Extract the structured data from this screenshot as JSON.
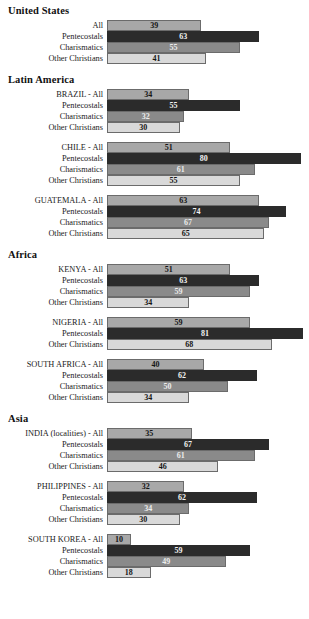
{
  "chart_data": {
    "type": "bar",
    "title": "",
    "subtitle": "",
    "xlabel": "",
    "ylabel": "",
    "xlim": [
      0,
      85
    ],
    "grid": false,
    "legend": null,
    "orientation": "horizontal",
    "series_names": [
      "All",
      "Pentecostals",
      "Charismatics",
      "Other Christians"
    ],
    "series_colors": {
      "All": "#a8a8a8",
      "Pentecostals": "#2b2b2b",
      "Charismatics": "#8a8a8a",
      "Other Christians": "#d9d9d9"
    },
    "scale_px_per_unit": 2.42,
    "regions": [
      {
        "name": "United States",
        "countries": [
          {
            "rows": [
              {
                "label": "All",
                "value": 39,
                "series": "All"
              },
              {
                "label": "Pentecostals",
                "value": 63,
                "series": "Pentecostals"
              },
              {
                "label": "Charismatics",
                "value": 55,
                "series": "Charismatics"
              },
              {
                "label": "Other Christians",
                "value": 41,
                "series": "Other Christians"
              }
            ]
          }
        ]
      },
      {
        "name": "Latin America",
        "countries": [
          {
            "rows": [
              {
                "label": "BRAZIL - All",
                "value": 34,
                "series": "All"
              },
              {
                "label": "Pentecostals",
                "value": 55,
                "series": "Pentecostals"
              },
              {
                "label": "Charismatics",
                "value": 32,
                "series": "Charismatics"
              },
              {
                "label": "Other Christians",
                "value": 30,
                "series": "Other Christians"
              }
            ]
          },
          {
            "rows": [
              {
                "label": "CHILE - All",
                "value": 51,
                "series": "All"
              },
              {
                "label": "Pentecostals",
                "value": 80,
                "series": "Pentecostals"
              },
              {
                "label": "Charismatics",
                "value": 61,
                "series": "Charismatics"
              },
              {
                "label": "Other Christians",
                "value": 55,
                "series": "Other Christians"
              }
            ]
          },
          {
            "rows": [
              {
                "label": "GUATEMALA - All",
                "value": 63,
                "series": "All"
              },
              {
                "label": "Pentecostals",
                "value": 74,
                "series": "Pentecostals"
              },
              {
                "label": "Charismatics",
                "value": 67,
                "series": "Charismatics"
              },
              {
                "label": "Other Christians",
                "value": 65,
                "series": "Other Christians"
              }
            ]
          }
        ]
      },
      {
        "name": "Africa",
        "countries": [
          {
            "rows": [
              {
                "label": "KENYA - All",
                "value": 51,
                "series": "All"
              },
              {
                "label": "Pentecostals",
                "value": 63,
                "series": "Pentecostals"
              },
              {
                "label": "Charismatics",
                "value": 59,
                "series": "Charismatics"
              },
              {
                "label": "Other Christians",
                "value": 34,
                "series": "Other Christians"
              }
            ]
          },
          {
            "rows": [
              {
                "label": "NIGERIA - All",
                "value": 59,
                "series": "All"
              },
              {
                "label": "Pentecostals",
                "value": 81,
                "series": "Pentecostals"
              },
              {
                "label": "Other Christians",
                "value": 68,
                "series": "Other Christians"
              }
            ]
          },
          {
            "rows": [
              {
                "label": "SOUTH AFRICA - All",
                "value": 40,
                "series": "All"
              },
              {
                "label": "Pentecostals",
                "value": 62,
                "series": "Pentecostals"
              },
              {
                "label": "Charismatics",
                "value": 50,
                "series": "Charismatics"
              },
              {
                "label": "Other Christians",
                "value": 34,
                "series": "Other Christians"
              }
            ]
          }
        ]
      },
      {
        "name": "Asia",
        "countries": [
          {
            "rows": [
              {
                "label": "INDIA (localities) - All",
                "value": 35,
                "series": "All"
              },
              {
                "label": "Pentecostals",
                "value": 67,
                "series": "Pentecostals"
              },
              {
                "label": "Charismatics",
                "value": 61,
                "series": "Charismatics"
              },
              {
                "label": "Other Christians",
                "value": 46,
                "series": "Other Christians"
              }
            ]
          },
          {
            "rows": [
              {
                "label": "PHILIPPINES - All",
                "value": 32,
                "series": "All"
              },
              {
                "label": "Pentecostals",
                "value": 62,
                "series": "Pentecostals"
              },
              {
                "label": "Charismatics",
                "value": 34,
                "series": "Charismatics"
              },
              {
                "label": "Other Christians",
                "value": 30,
                "series": "Other Christians"
              }
            ]
          },
          {
            "rows": [
              {
                "label": "SOUTH KOREA - All",
                "value": 10,
                "series": "All"
              },
              {
                "label": "Pentecostals",
                "value": 59,
                "series": "Pentecostals"
              },
              {
                "label": "Charismatics",
                "value": 49,
                "series": "Charismatics"
              },
              {
                "label": "Other Christians",
                "value": 18,
                "series": "Other Christians"
              }
            ]
          }
        ]
      }
    ]
  }
}
